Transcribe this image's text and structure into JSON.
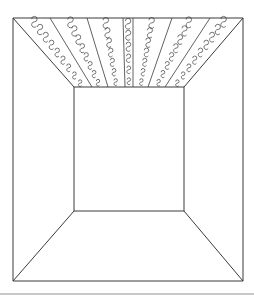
{
  "image": {
    "subject": "line drawing of a room interior in one-point perspective with decorated ceiling stripes",
    "colors": {
      "ink": "#3a3a3a",
      "background": "#ffffff",
      "band": "#c8c8c8"
    }
  },
  "geometry": {
    "outer": {
      "x1": 13,
      "y1": 18,
      "x2": 243,
      "y2": 281
    },
    "inner": {
      "x1": 74,
      "y1": 87,
      "x2": 184,
      "y2": 211
    },
    "ceiling_stripes": [
      {
        "top": [
          50,
          18
        ],
        "bottom": [
          92,
          87
        ]
      },
      {
        "top": [
          87,
          18
        ],
        "bottom": [
          108,
          87
        ]
      },
      {
        "top": [
          123,
          18
        ],
        "bottom": [
          125,
          87
        ]
      },
      {
        "top": [
          133,
          18
        ],
        "bottom": [
          133,
          87
        ]
      },
      {
        "top": [
          172,
          18
        ],
        "bottom": [
          148,
          87
        ]
      },
      {
        "top": [
          210,
          18
        ],
        "bottom": [
          165,
          87
        ]
      }
    ]
  }
}
